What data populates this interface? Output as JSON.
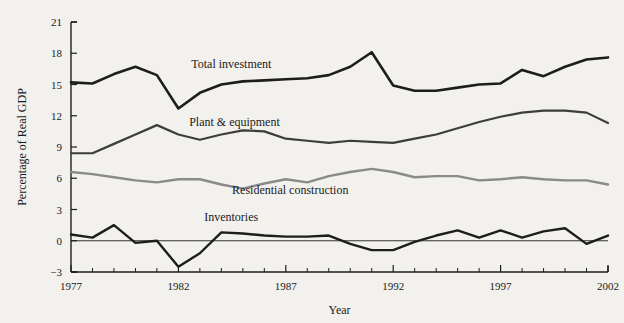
{
  "chart_data": {
    "type": "line",
    "title": "",
    "xlabel": "Year",
    "ylabel": "Percentage of Real GDP",
    "xlim": [
      1977,
      2002
    ],
    "ylim": [
      -3,
      21
    ],
    "grid": false,
    "legend_position": "inline-annotations",
    "x": [
      1977,
      1978,
      1979,
      1980,
      1981,
      1982,
      1983,
      1984,
      1985,
      1986,
      1987,
      1988,
      1989,
      1990,
      1991,
      1992,
      1993,
      1994,
      1995,
      1996,
      1997,
      1998,
      1999,
      2000,
      2001,
      2002
    ],
    "y_ticks": [
      -3,
      0,
      3,
      6,
      9,
      12,
      15,
      18,
      21
    ],
    "y_tick_labels": [
      "−3",
      "0",
      "3",
      "6",
      "9",
      "12",
      "15",
      "18",
      "21"
    ],
    "x_major_ticks": [
      1977,
      1982,
      1987,
      1992,
      1997,
      2002
    ],
    "x_major_tick_labels": [
      "1977",
      "1982",
      "1987",
      "1992",
      "1997",
      "2002"
    ],
    "series": [
      {
        "name": "Total investment",
        "color": "#1d1d1d",
        "width": 2.6,
        "label_x": 1982.6,
        "label_y": 16.6,
        "values": [
          15.2,
          15.1,
          16.0,
          16.7,
          15.9,
          12.7,
          14.2,
          15.0,
          15.3,
          15.4,
          15.5,
          15.6,
          15.9,
          16.7,
          18.1,
          14.9,
          14.4,
          14.4,
          14.7,
          15.0,
          15.1,
          16.4,
          15.8,
          16.7,
          17.4,
          17.6
        ]
      },
      {
        "name": "Plant & equipment",
        "color": "#3d3d3d",
        "width": 2.2,
        "label_x": 1982.5,
        "label_y": 11.0,
        "values": [
          8.4,
          8.4,
          9.3,
          10.2,
          11.1,
          10.2,
          9.7,
          10.2,
          10.6,
          10.5,
          9.8,
          9.6,
          9.4,
          9.6,
          9.5,
          9.4,
          9.8,
          10.2,
          10.8,
          11.4,
          11.9,
          12.3,
          12.5,
          12.5,
          12.3,
          11.3
        ]
      },
      {
        "name": "Residential construction",
        "color": "#8a8a8a",
        "width": 2.4,
        "label_x": 1984.5,
        "label_y": 4.5,
        "values": [
          6.6,
          6.4,
          6.1,
          5.8,
          5.6,
          5.9,
          5.9,
          5.4,
          5.0,
          5.5,
          5.9,
          5.6,
          6.2,
          6.6,
          6.9,
          6.6,
          6.1,
          6.2,
          6.2,
          5.8,
          5.9,
          6.1,
          5.9,
          5.8,
          5.8,
          5.4
        ]
      },
      {
        "name": "Inventories",
        "color": "#1d1d1d",
        "width": 2.4,
        "label_x": 1983.2,
        "label_y": 1.9,
        "values": [
          0.6,
          0.3,
          1.5,
          -0.2,
          0.0,
          -2.5,
          -1.2,
          0.8,
          0.7,
          0.5,
          0.4,
          0.4,
          0.5,
          -0.3,
          -0.9,
          -0.9,
          -0.1,
          0.5,
          1.0,
          0.3,
          1.0,
          0.3,
          0.9,
          1.2,
          -0.3,
          0.5
        ]
      }
    ]
  }
}
